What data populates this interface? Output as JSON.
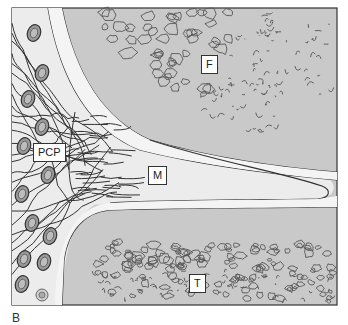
{
  "figure": {
    "panel_letter": "B",
    "labels": {
      "pcp": "PCP",
      "m": "M",
      "f": "F",
      "t": "T"
    },
    "colors": {
      "background": "#ffffff",
      "light_zone": "#ececec",
      "mid_zone": "#c9c9c9",
      "outline": "#333333",
      "cell_fill": "#9a9a9a",
      "cell_inner": "#bdbdbd",
      "label_bg": "#ffffff"
    },
    "regions": [
      "F",
      "M",
      "T",
      "PCP"
    ],
    "cell_count_left": 12
  }
}
